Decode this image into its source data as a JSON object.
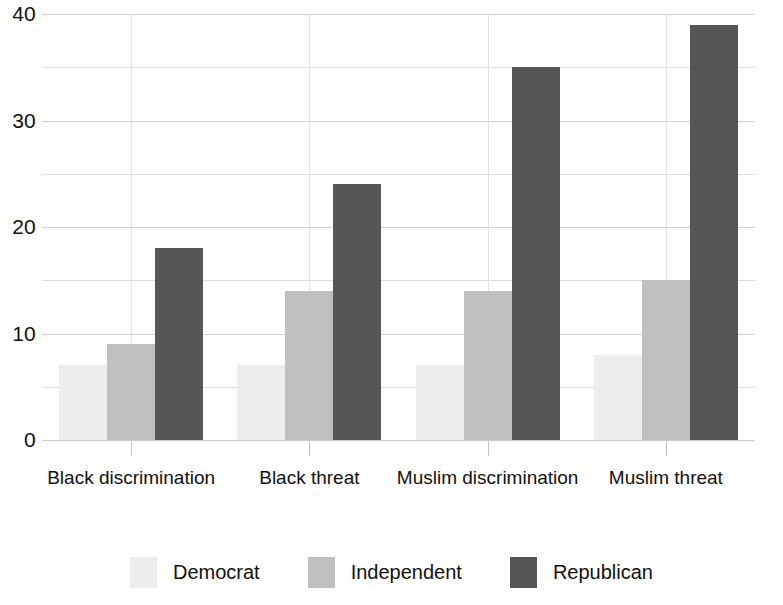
{
  "chart_data": {
    "type": "bar",
    "title": "",
    "subtitle": "",
    "xlabel": "",
    "ylabel": "",
    "categories": [
      "Black discrimination",
      "Black threat",
      "Muslim discrimination",
      "Muslim threat"
    ],
    "series": [
      {
        "name": "Democrat",
        "color": "#ededed",
        "values": [
          7,
          7,
          7,
          8
        ]
      },
      {
        "name": "Independent",
        "color": "#bfbfbf",
        "values": [
          9,
          14,
          14,
          15
        ]
      },
      {
        "name": "Republican",
        "color": "#565656",
        "values": [
          18,
          24,
          35,
          39
        ]
      }
    ],
    "ylim": [
      0,
      40
    ],
    "y_ticks": [
      0,
      10,
      20,
      30,
      40
    ],
    "y_tick_labels": [
      "0",
      "10",
      "20",
      "30",
      "40"
    ],
    "y_minor_gridlines": [
      5,
      15,
      25,
      35
    ],
    "grid": true,
    "legend_position": "bottom",
    "annotations": []
  },
  "legend": {
    "items": [
      {
        "label": "Democrat"
      },
      {
        "label": "Independent"
      },
      {
        "label": "Republican"
      }
    ]
  }
}
